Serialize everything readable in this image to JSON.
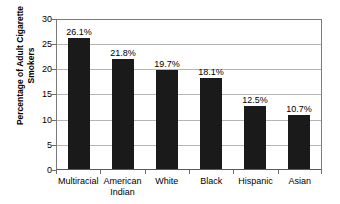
{
  "chart_data": {
    "type": "bar",
    "title": "",
    "xlabel": "",
    "ylabel": "Percentage of Adult Cigarette Smokers",
    "ylabel_lines": [
      "Percentage of Adult Cigarette",
      "Smokers"
    ],
    "categories": [
      "Multiracial",
      "American Indian",
      "White",
      "Black",
      "Hispanic",
      "Asian"
    ],
    "category_lines": [
      [
        "Multiracial"
      ],
      [
        "American",
        "Indian"
      ],
      [
        "White"
      ],
      [
        "Black"
      ],
      [
        "Hispanic"
      ],
      [
        "Asian"
      ]
    ],
    "values": [
      26.1,
      21.8,
      19.7,
      18.1,
      12.5,
      10.7
    ],
    "data_labels": [
      "26.1%",
      "21.8%",
      "19.7%",
      "18.1%",
      "12.5%",
      "10.7%"
    ],
    "ylim": [
      0,
      30
    ],
    "yticks": [
      0,
      5,
      10,
      15,
      20,
      25,
      30
    ],
    "ytick_labels": [
      "0",
      "5",
      "10",
      "15",
      "20",
      "25",
      "30"
    ],
    "grid": true,
    "grid_axis": "y",
    "legend": false,
    "legend_position": "none",
    "colors": {
      "bar": "#1a1a1a",
      "gridline": "#b5b5b5",
      "axis": "#7a7a7a",
      "background": "#ffffff",
      "text": "#000000"
    }
  }
}
